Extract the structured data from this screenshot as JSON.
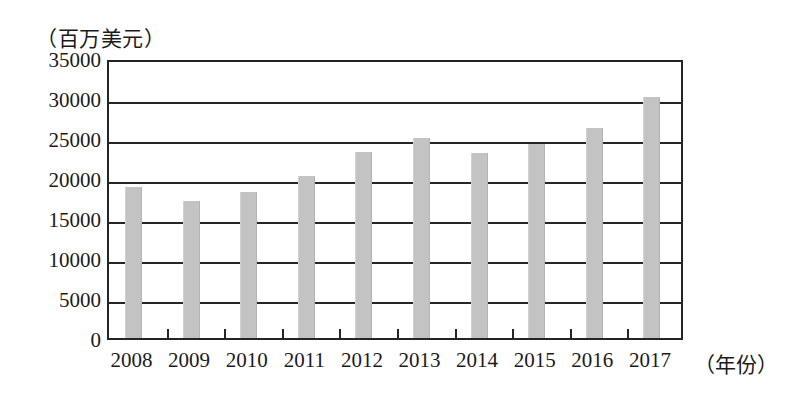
{
  "chart_data": {
    "type": "bar",
    "title": "",
    "subtitle": "",
    "xlabel": "（年份）",
    "ylabel": "（百万美元）",
    "categories": [
      "2008",
      "2009",
      "2010",
      "2011",
      "2012",
      "2013",
      "2014",
      "2015",
      "2016",
      "2017"
    ],
    "values": [
      18900,
      17100,
      18300,
      20300,
      23300,
      25000,
      23100,
      24300,
      26300,
      30100
    ],
    "ylim": [
      0,
      35000
    ],
    "ytick_labels": [
      "0",
      "5000",
      "10000",
      "15000",
      "20000",
      "25000",
      "30000",
      "35000"
    ],
    "ytick_values": [
      0,
      5000,
      10000,
      15000,
      20000,
      25000,
      30000,
      35000
    ],
    "grid": "horizontal",
    "legend": "none",
    "bar_color": "#c3c3c3",
    "axis_color": "#252525",
    "background_color": "#ffffff"
  }
}
